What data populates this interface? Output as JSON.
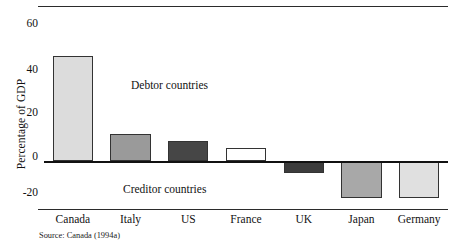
{
  "figure": {
    "source_note": "Source: Canada (1994a)"
  },
  "chart_data": {
    "type": "bar",
    "title": "",
    "xlabel": "",
    "ylabel": "Percentage of GDP",
    "categories": [
      "Canada",
      "Italy",
      "US",
      "France",
      "UK",
      "Japan",
      "Germany"
    ],
    "values": [
      43,
      11,
      8,
      5.5,
      -5,
      -15,
      -15
    ],
    "ylim": [
      -20,
      60
    ],
    "yticks": [
      60,
      40,
      20,
      0,
      -20
    ],
    "ytick_labels": [
      "60",
      "40",
      "20",
      "0",
      "-20"
    ],
    "grid": false,
    "legend": "none",
    "bar_colors": [
      "#dcdcdc",
      "#9a9a9a",
      "#464646",
      "#ffffff",
      "#3c3c3c",
      "#a8a8a8",
      "#e0e0e0"
    ],
    "bar_edge_color": "#333333",
    "baseline_color": "#111111",
    "annotations": [
      {
        "text": "Debtor countries",
        "x": "Italy",
        "y": 36
      },
      {
        "text": "Creditor countries",
        "x": "Italy",
        "y": -12
      }
    ]
  }
}
